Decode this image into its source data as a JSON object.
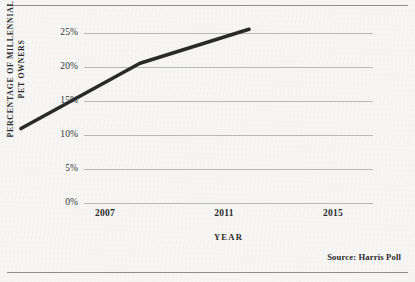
{
  "figure": {
    "title_fragment": "",
    "source_note": "Source: Harris Poll",
    "rule_color": "#8e8e8e",
    "background_color": "#eceae7"
  },
  "chart_data": {
    "type": "line",
    "title": "",
    "subtitle": "",
    "xlabel": "YEAR",
    "ylabel": "PERCENTAGE OF MILLENNIAL PET OWNERS",
    "ylabel_lines": [
      "PERCENTAGE OF MILLENNIAL",
      "PET OWNERS"
    ],
    "categories": [
      "2007",
      "2011",
      "2015"
    ],
    "x": [
      2007,
      2011,
      2015
    ],
    "values": [
      6.1,
      15.7,
      20.7
    ],
    "series": [
      {
        "name": "Percentage of millennial pet owners",
        "values": [
          6.1,
          15.7,
          20.7
        ],
        "color": "#2a2a2a",
        "line_width": 3.6,
        "markers": false
      }
    ],
    "ylim": [
      0,
      25
    ],
    "ytick_values": [
      0,
      5,
      10,
      15,
      20,
      25
    ],
    "ytick_labels": [
      "0%",
      "5%",
      "10%",
      "15%",
      "20%",
      "25%"
    ],
    "xtick_labels": [
      "2007",
      "2011",
      "2015"
    ],
    "grid": true,
    "grid_axis": "y",
    "grid_color": "#b9b9b9",
    "legend": false,
    "legend_position": "none"
  }
}
